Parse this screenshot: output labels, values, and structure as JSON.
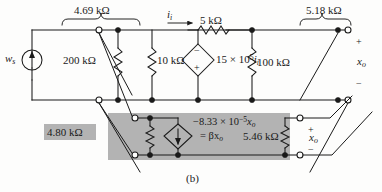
{
  "figure": {
    "caption": "(b)",
    "type": "circuit-schematic",
    "background_color": "#fdfdfc",
    "wire_color": "#1a1a1a",
    "highlight_box_color": "#b3b3b3"
  },
  "sources": {
    "independent": {
      "name": "w_s",
      "label_main": "w",
      "label_sub": "s",
      "symbol": "current-source-circle-up-arrow"
    },
    "dependent_voltage": {
      "label_prefix": "15 × 10",
      "label_exp": "5",
      "label_var": "i",
      "label_var_sub": "i",
      "symbol": "diamond-voltage-source",
      "polarity_top": "−",
      "polarity_bottom": "+"
    },
    "dependent_current": {
      "line1_prefix": "−8.33 × 10",
      "line1_exp": "−5",
      "line1_var": "x",
      "line1_var_sub": "o",
      "line2": "= βx",
      "line2_sub": "o",
      "symbol": "diamond-current-source-down-arrow"
    }
  },
  "resistors": [
    {
      "id": "r-200k",
      "value": "200 kΩ",
      "orientation": "vertical"
    },
    {
      "id": "r-10k",
      "value": "10 kΩ",
      "orientation": "vertical"
    },
    {
      "id": "r-5k",
      "value": "5 kΩ",
      "orientation": "horizontal"
    },
    {
      "id": "r-100k",
      "value": "100 kΩ",
      "orientation": "vertical"
    },
    {
      "id": "r-480",
      "value": "4.80 kΩ",
      "orientation": "vertical"
    },
    {
      "id": "r-546",
      "value": "5.46 kΩ",
      "orientation": "vertical"
    }
  ],
  "brace_labels": [
    {
      "id": "brace-469",
      "value": "4.69 kΩ"
    },
    {
      "id": "brace-518",
      "value": "5.18 kΩ"
    }
  ],
  "currents": [
    {
      "id": "i-input",
      "label": "i",
      "sub": "i",
      "direction": "right"
    }
  ],
  "port_labels": [
    {
      "id": "xo-right",
      "label": "x",
      "sub": "o",
      "plus": "+",
      "minus": "−"
    },
    {
      "id": "xo-middle",
      "label": "x",
      "sub": "o",
      "plus": "+",
      "minus": "−"
    }
  ]
}
